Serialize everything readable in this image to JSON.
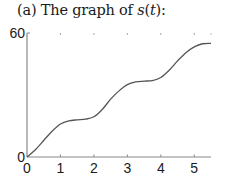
{
  "title": {
    "prefix": "(a)  The graph of ",
    "func": "s",
    "open": "(",
    "var": "t",
    "close": "):"
  },
  "chart_data": {
    "type": "line",
    "title": "(a) The graph of s(t):",
    "xlabel": "",
    "ylabel": "",
    "xlim": [
      0,
      5.5
    ],
    "ylim": [
      0,
      60
    ],
    "x_ticks": [
      "0",
      "1",
      "2",
      "3",
      "4",
      "5"
    ],
    "y_ticks": [
      "0",
      "60"
    ],
    "grid": false,
    "legend": null,
    "series": [
      {
        "name": "s(t)",
        "x": [
          0,
          0.25,
          0.5,
          0.75,
          1.0,
          1.25,
          1.5,
          1.75,
          2.0,
          2.25,
          2.5,
          2.75,
          3.0,
          3.25,
          3.5,
          3.75,
          4.0,
          4.25,
          4.5,
          4.75,
          5.0,
          5.25,
          5.5
        ],
        "values": [
          0,
          3.5,
          8,
          12.5,
          16,
          17.5,
          18,
          18.3,
          19.5,
          23,
          28,
          32,
          35,
          36.3,
          36.7,
          37,
          38.5,
          42,
          46.5,
          50.5,
          53.3,
          54.8,
          55
        ]
      }
    ],
    "color": "#555555"
  }
}
